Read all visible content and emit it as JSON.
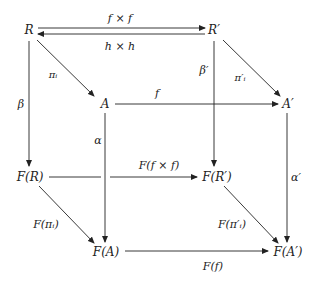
{
  "diagram": {
    "type": "commutative-cube",
    "nodes": {
      "R": "R",
      "Rp": "R′",
      "A": "A",
      "Ap": "A′",
      "FR": "F(R)",
      "FRp": "F(R′)",
      "FA": "F(A)",
      "FAp": "F(A′)"
    },
    "arrows": {
      "f_times_f": "f × f",
      "h_times_h": "h × h",
      "pi_i": "πᵢ",
      "pi_i_prime": "π′ᵢ",
      "beta": "β",
      "beta_prime": "β′",
      "f": "f",
      "alpha": "α",
      "alpha_prime": "α′",
      "F_f_times_f": "F(f × f)",
      "F_pi_i": "F(πᵢ)",
      "F_pi_i_prime": "F(π′ᵢ)",
      "F_f": "F(f)"
    },
    "color": "#222222"
  }
}
